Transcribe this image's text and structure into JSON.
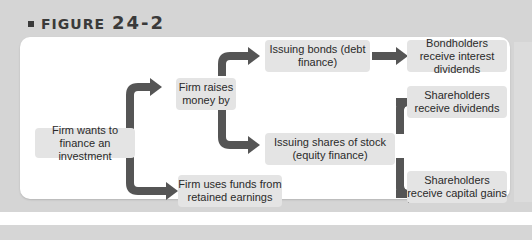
{
  "figure": {
    "label": "FIGURE",
    "number": "24-2"
  },
  "nodes": {
    "start": "Firm wants to finance an investment",
    "raises": "Firm raises money by",
    "retained": "Firm uses funds from retained earnings",
    "bonds": "Issuing bonds (debt finance)",
    "shares": "Issuing shares of stock (equity finance)",
    "bondholders": "Bondholders receive interest dividends",
    "share_dividends": "Shareholders receive dividends",
    "share_gains": "Shareholders receive capital gains"
  },
  "nodes_lines": {
    "start": [
      "Firm wants to finance",
      "an investment"
    ],
    "raises": [
      "Firm raises",
      "money by"
    ],
    "retained": [
      "Firm uses funds from",
      "retained earnings"
    ],
    "bonds": [
      "Issuing bonds",
      "(debt finance)"
    ],
    "shares": [
      "Issuing shares of stock",
      "(equity finance)"
    ],
    "bondholders": [
      "Bondholders receive",
      "interest dividends"
    ],
    "share_dividends": [
      "Shareholders receive",
      "dividends"
    ],
    "share_gains": [
      "Shareholders receive",
      "capital gains"
    ]
  },
  "colors": {
    "arrow": "#555555",
    "box": "#e4e4e4",
    "frame": "#d5d5d5",
    "panel": "#ffffff"
  }
}
